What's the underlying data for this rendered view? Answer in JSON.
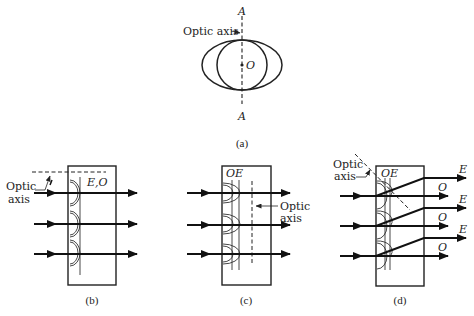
{
  "figure": {
    "panels": [
      {
        "id": "a",
        "caption": "(a)",
        "axis_top_label": "A",
        "axis_bottom_label": "A",
        "center_label": "O",
        "optic_axis_label": "Optic axis",
        "description": "Circular (ordinary) and elliptical (extraordinary) wave surfaces sharing optic axis A–A"
      },
      {
        "id": "b",
        "caption": "(b)",
        "wavefront_label": "E,O",
        "optic_axis_label_line1": "Optic",
        "optic_axis_label_line2": "axis",
        "description": "Optic axis parallel to surface, perpendicular to the page direction shown by dashed line; E and O coincide"
      },
      {
        "id": "c",
        "caption": "(c)",
        "wavefront_label": "OE",
        "optic_axis_label_line1": "Optic",
        "optic_axis_label_line2": "axis",
        "description": "Optic axis parallel to surface; O and E travel same direction at different speeds"
      },
      {
        "id": "d",
        "caption": "(d)",
        "wavefront_label": "OE",
        "optic_axis_label_line1": "Optic",
        "optic_axis_label_line2": "axis",
        "ray_labels": [
          "E",
          "O",
          "E",
          "O",
          "E",
          "O"
        ],
        "description": "Optic axis oblique; E ray deviates from O ray"
      }
    ]
  }
}
